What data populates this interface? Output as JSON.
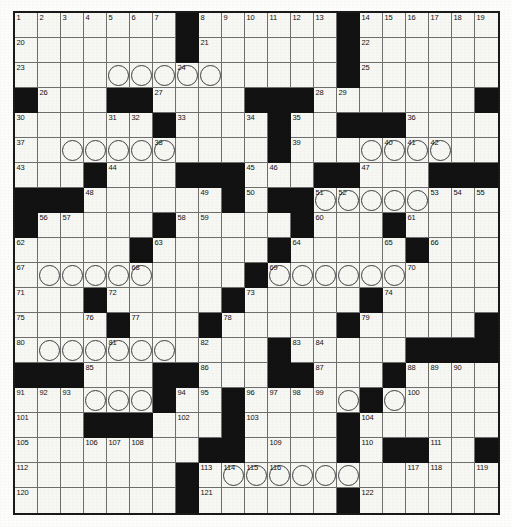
{
  "puzzle": {
    "type": "crossword-grid",
    "columns": 21,
    "rows": 20,
    "cell_size_px": 23,
    "colors": {
      "block": "#121212",
      "cell": "#f7f7f4",
      "grid_line": "#6f6f6f",
      "border": "#1a1a1a",
      "number_text": "#111111"
    },
    "legend": {
      "black_square": "blocked-cell",
      "circled_cell": "circled-letter-cell"
    },
    "rows_data": [
      {
        "r": 0,
        "blocks": [
          7,
          14
        ],
        "numbers": {
          "0": "1",
          "1": "2",
          "2": "3",
          "3": "4",
          "4": "5",
          "5": "6",
          "6": "7",
          "8": "8",
          "9": "9",
          "10": "10",
          "11": "11",
          "12": "12",
          "13": "13",
          "15": "14",
          "16": "15",
          "17": "16",
          "18": "17",
          "19": "18",
          "20": "19"
        },
        "circles": []
      },
      {
        "r": 1,
        "blocks": [
          7,
          14
        ],
        "numbers": {
          "0": "20",
          "8": "21",
          "15": "22"
        },
        "circles": []
      },
      {
        "r": 2,
        "blocks": [
          14
        ],
        "numbers": {
          "0": "23",
          "7": "24",
          "15": "25"
        },
        "circles": [
          4,
          5,
          6,
          7,
          8
        ]
      },
      {
        "r": 3,
        "blocks": [
          0,
          4,
          5,
          10,
          11,
          12,
          20
        ],
        "numbers": {
          "1": "26",
          "6": "27",
          "13": "28",
          "14": "29"
        },
        "circles": []
      },
      {
        "r": 4,
        "blocks": [
          6,
          11,
          14,
          15,
          16
        ],
        "numbers": {
          "0": "30",
          "4": "31",
          "5": "32",
          "7": "33",
          "10": "34",
          "12": "35",
          "17": "36"
        },
        "circles": []
      },
      {
        "r": 5,
        "blocks": [
          11
        ],
        "numbers": {
          "0": "37",
          "6": "38",
          "12": "39",
          "16": "40",
          "17": "41",
          "18": "42"
        },
        "circles": [
          2,
          3,
          4,
          5,
          6,
          15,
          16,
          17,
          18
        ]
      },
      {
        "r": 6,
        "blocks": [
          3,
          7,
          8,
          9,
          13,
          14,
          18,
          19,
          20
        ],
        "numbers": {
          "0": "43",
          "4": "44",
          "10": "45",
          "11": "46",
          "15": "47"
        },
        "circles": []
      },
      {
        "r": 7,
        "blocks": [
          0,
          1,
          2,
          9,
          11,
          12
        ],
        "numbers": {
          "3": "48",
          "8": "49",
          "10": "50",
          "13": "51",
          "14": "52",
          "18": "53",
          "19": "54",
          "20": "55"
        },
        "circles": [
          13,
          14,
          15,
          16,
          17
        ]
      },
      {
        "r": 8,
        "blocks": [
          0,
          6,
          12,
          16
        ],
        "numbers": {
          "1": "56",
          "2": "57",
          "7": "58",
          "8": "59",
          "13": "60",
          "17": "61"
        },
        "circles": []
      },
      {
        "r": 9,
        "blocks": [
          5,
          11,
          17
        ],
        "numbers": {
          "0": "62",
          "6": "63",
          "12": "64",
          "16": "65",
          "18": "66"
        },
        "circles": []
      },
      {
        "r": 10,
        "blocks": [
          10
        ],
        "numbers": {
          "0": "67",
          "5": "68",
          "11": "69",
          "17": "70"
        },
        "circles": [
          1,
          2,
          3,
          4,
          5,
          11,
          12,
          13,
          14,
          15,
          16
        ]
      },
      {
        "r": 11,
        "blocks": [
          3,
          9,
          15
        ],
        "numbers": {
          "0": "71",
          "4": "72",
          "10": "73",
          "16": "74"
        },
        "circles": []
      },
      {
        "r": 12,
        "blocks": [
          4,
          8,
          14,
          20
        ],
        "numbers": {
          "0": "75",
          "3": "76",
          "5": "77",
          "9": "78",
          "15": "79"
        },
        "circles": []
      },
      {
        "r": 13,
        "blocks": [
          11,
          17,
          18,
          19,
          20
        ],
        "numbers": {
          "0": "80",
          "4": "81",
          "8": "82",
          "12": "83",
          "13": "84"
        },
        "circles": [
          1,
          2,
          3,
          4,
          5,
          6
        ]
      },
      {
        "r": 14,
        "blocks": [
          0,
          1,
          2,
          6,
          7,
          11,
          12,
          16
        ],
        "numbers": {
          "3": "85",
          "8": "86",
          "13": "87",
          "17": "88",
          "18": "89",
          "19": "90"
        },
        "circles": []
      },
      {
        "r": 15,
        "blocks": [
          6,
          9,
          15
        ],
        "numbers": {
          "0": "91",
          "1": "92",
          "2": "93",
          "7": "94",
          "8": "95",
          "10": "96",
          "11": "97",
          "12": "98",
          "13": "99",
          "17": "100"
        },
        "circles": [
          3,
          4,
          5,
          14,
          15,
          16
        ]
      },
      {
        "r": 16,
        "blocks": [
          3,
          4,
          5,
          9,
          14
        ],
        "numbers": {
          "0": "101",
          "7": "102",
          "10": "103",
          "15": "104"
        },
        "circles": []
      },
      {
        "r": 17,
        "blocks": [
          8,
          9,
          14,
          16,
          17,
          20
        ],
        "numbers": {
          "0": "105",
          "3": "106",
          "4": "107",
          "5": "108",
          "11": "109",
          "15": "110",
          "18": "111"
        },
        "circles": []
      },
      {
        "r": 18,
        "blocks": [
          7
        ],
        "numbers": {
          "0": "112",
          "8": "113",
          "9": "114",
          "10": "115",
          "11": "116",
          "17": "117",
          "18": "118",
          "20": "119"
        },
        "circles": [
          9,
          10,
          11,
          12,
          13,
          14
        ]
      },
      {
        "r": 19,
        "blocks": [
          7,
          14
        ],
        "numbers": {
          "0": "120",
          "8": "121",
          "15": "122"
        },
        "circles": []
      },
      {
        "r": 20,
        "blocks": [
          7,
          14
        ],
        "numbers": {
          "0": "123",
          "8": "124",
          "15": "125"
        },
        "circles": []
      }
    ]
  }
}
